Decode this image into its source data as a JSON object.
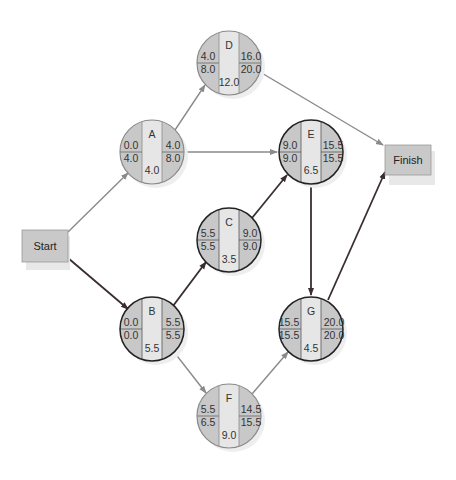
{
  "diagram": {
    "title": "",
    "colors": {
      "critical_edge": "#3a2e33",
      "normal_edge": "#8a8a8a",
      "circle_side": "#c8c8c8",
      "circle_middle": "#e6e6e6",
      "box_fill": "#c9c9c9",
      "critical_outline": "#222222",
      "normal_outline": "#8a8a8a"
    },
    "start": {
      "label": "Start"
    },
    "finish": {
      "label": "Finish"
    },
    "nodes": [
      {
        "id": "A",
        "es": "0.0",
        "ls": "4.0",
        "ef": "4.0",
        "lf": "8.0",
        "duration": "4.0",
        "critical": false
      },
      {
        "id": "B",
        "es": "0.0",
        "ls": "0.0",
        "ef": "5.5",
        "lf": "5.5",
        "duration": "5.5",
        "critical": true
      },
      {
        "id": "C",
        "es": "5.5",
        "ls": "5.5",
        "ef": "9.0",
        "lf": "9.0",
        "duration": "3.5",
        "critical": true
      },
      {
        "id": "D",
        "es": "4.0",
        "ls": "8.0",
        "ef": "16.0",
        "lf": "20.0",
        "duration": "12.0",
        "critical": false
      },
      {
        "id": "E",
        "es": "9.0",
        "ls": "9.0",
        "ef": "15.5",
        "lf": "15.5",
        "duration": "6.5",
        "critical": true
      },
      {
        "id": "F",
        "es": "5.5",
        "ls": "6.5",
        "ef": "14.5",
        "lf": "15.5",
        "duration": "9.0",
        "critical": false
      },
      {
        "id": "G",
        "es": "15.5",
        "ls": "15.5",
        "ef": "20.0",
        "lf": "20.0",
        "duration": "4.5",
        "critical": true
      }
    ],
    "edges": [
      {
        "from": "Start",
        "to": "A",
        "critical": false
      },
      {
        "from": "Start",
        "to": "B",
        "critical": true
      },
      {
        "from": "A",
        "to": "D",
        "critical": false
      },
      {
        "from": "A",
        "to": "E",
        "critical": false
      },
      {
        "from": "B",
        "to": "C",
        "critical": true
      },
      {
        "from": "B",
        "to": "F",
        "critical": false
      },
      {
        "from": "C",
        "to": "E",
        "critical": true
      },
      {
        "from": "D",
        "to": "Finish",
        "critical": false
      },
      {
        "from": "E",
        "to": "G",
        "critical": true
      },
      {
        "from": "F",
        "to": "G",
        "critical": false
      },
      {
        "from": "G",
        "to": "Finish",
        "critical": true
      }
    ]
  }
}
